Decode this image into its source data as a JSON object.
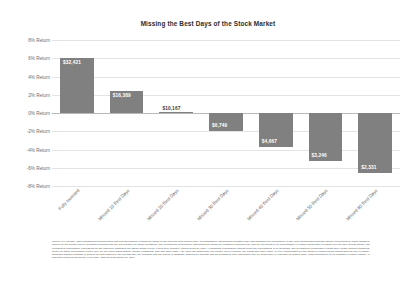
{
  "chart_data": {
    "type": "bar",
    "title": "Missing the Best Days of the Stock Market",
    "xlabel": "",
    "ylabel": "",
    "ylim": [
      -8,
      8
    ],
    "grid": true,
    "legend": "none",
    "categories": [
      "Fully Invested",
      "Missed 10 Best Days",
      "Missed 20 Best Days",
      "Missed 30 Best Days",
      "Missed 40 Best Days",
      "Missed 50 Best Days",
      "Missed 60 Best Days"
    ],
    "values": [
      6.06,
      2.44,
      0.08,
      -1.95,
      -3.72,
      -5.24,
      -6.59
    ],
    "data_labels": [
      "$32,421",
      "$16,389",
      "$10,167",
      "$6,749",
      "$4,667",
      "$3,246",
      "$2,331"
    ],
    "ytick_labels": [
      "8% Return",
      "6% Return",
      "4% Return",
      "2% Return",
      "0% Return",
      "-2% Return",
      "-4% Return",
      "-6% Return",
      "-8% Return"
    ],
    "ytick_values": [
      8,
      6,
      4,
      2,
      0,
      -2,
      -4,
      -6,
      -8
    ],
    "bar_color": "#808080",
    "gridline_color": "#e3e3e3",
    "zero_line_color": "#b9b9b9"
  },
  "footnote": {
    "text": "Source: J.P. Morgan Asset Management analysis using data from Bloomberg. Returns are based on the S&P 500 Total Return Index, an unmanaged, capitalization-weighted index that measures the performance of 500 large capitalization domestic stocks representing all major industries. Indices do not include fees or operating expenses and are not available for actual investment. The hypothetical performance calculations are shown for illustrative purposes only and are not meant to be representative of actual results while investing over the time periods shown. The hypothetical performance calculations for the respective strategies are shown gross of fees. If fees were included, returns would be lower. Hypothetical performance returns reflect the reinvestment of all dividends. The hypothetical performance results have certain inherent limitations. Unlike an actual performance record, they do not reflect actual trading, liquidity constraints, fees and other costs. Also, since the trades have not actually been executed, the results may have under- or over-compensated for the impact of certain market factors such as lack of liquidity. Simulated trading programs in general are also subject to the fact that they are designed with the benefit of hindsight. Returns will fluctuate and an investment upon redemption may be worth more or less than its original value. Past performance is not indicative of future returns. An individual cannot invest directly in an index. Data as of December 31, 2019."
  }
}
